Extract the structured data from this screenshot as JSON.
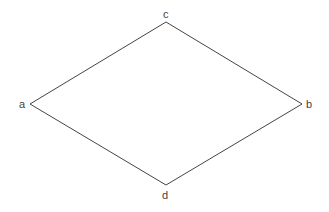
{
  "diagram": {
    "type": "rhombus",
    "stroke_color": "#444444",
    "vertices": [
      {
        "label": "c",
        "x": 166,
        "y": 22
      },
      {
        "label": "b",
        "x": 302,
        "y": 104
      },
      {
        "label": "d",
        "x": 166,
        "y": 185
      },
      {
        "label": "a",
        "x": 30,
        "y": 104
      }
    ],
    "labels": {
      "a": "a",
      "b": "b",
      "c": "c",
      "d": "d"
    }
  }
}
